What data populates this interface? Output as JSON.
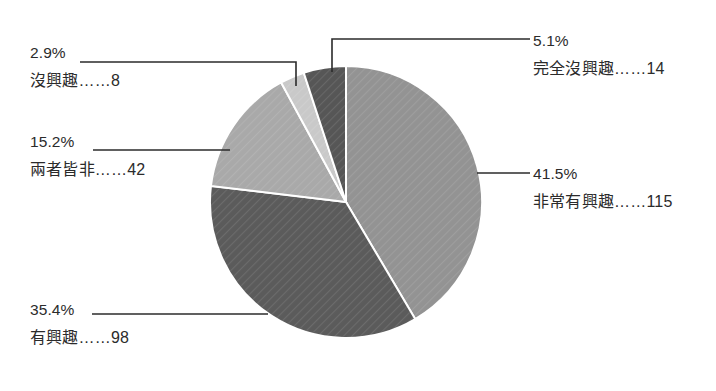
{
  "chart_data": {
    "type": "pie",
    "title": "",
    "subtitle": "",
    "xlabel": "",
    "ylabel": "",
    "legend_position": "none",
    "grid": false,
    "total": 277,
    "categories": [
      "非常有興趣",
      "有興趣",
      "兩者皆非",
      "沒興趣",
      "完全沒興趣"
    ],
    "values": [
      115,
      98,
      42,
      8,
      14
    ],
    "percentages": [
      41.5,
      35.4,
      15.2,
      2.9,
      5.1
    ],
    "slices": [
      {
        "id": "very-interested",
        "name": "非常有興趣",
        "value": 115,
        "percent": 41.5,
        "percent_text": "41.5%",
        "label_text": "非常有興趣……115",
        "color": "#939393",
        "start_angle": 0,
        "end_angle": 149.4,
        "leader": "straight",
        "side": "right"
      },
      {
        "id": "interested",
        "name": "有興趣",
        "value": 98,
        "percent": 35.4,
        "percent_text": "35.4%",
        "label_text": "有興趣……98",
        "color": "#5b5b5b",
        "start_angle": 149.4,
        "end_angle": 276.8,
        "leader": "straight",
        "side": "left"
      },
      {
        "id": "neither",
        "name": "兩者皆非",
        "value": 42,
        "percent": 15.2,
        "percent_text": "15.2%",
        "label_text": "兩者皆非……42",
        "color": "#a9a9a9",
        "start_angle": 276.8,
        "end_angle": 331.5,
        "leader": "straight",
        "side": "left"
      },
      {
        "id": "not-interested",
        "name": "沒興趣",
        "value": 8,
        "percent": 2.9,
        "percent_text": "2.9%",
        "label_text": "沒興趣……8",
        "color": "#c9c9c9",
        "start_angle": 331.5,
        "end_angle": 341.9,
        "leader": "elbow",
        "side": "left"
      },
      {
        "id": "completely-not-interested",
        "name": "完全沒興趣",
        "value": 14,
        "percent": 5.1,
        "percent_text": "5.1%",
        "label_text": "完全沒興趣……14",
        "color": "#565656",
        "start_angle": 341.9,
        "end_angle": 360,
        "leader": "elbow",
        "side": "right"
      }
    ],
    "geometry": {
      "center_x": 346,
      "center_y": 202,
      "radius": 136
    },
    "style": {
      "background": "#ffffff",
      "slice_border": "#ffffff",
      "leader_line_color": "#2b2b2b",
      "text_color": "#2b2b2b"
    }
  }
}
